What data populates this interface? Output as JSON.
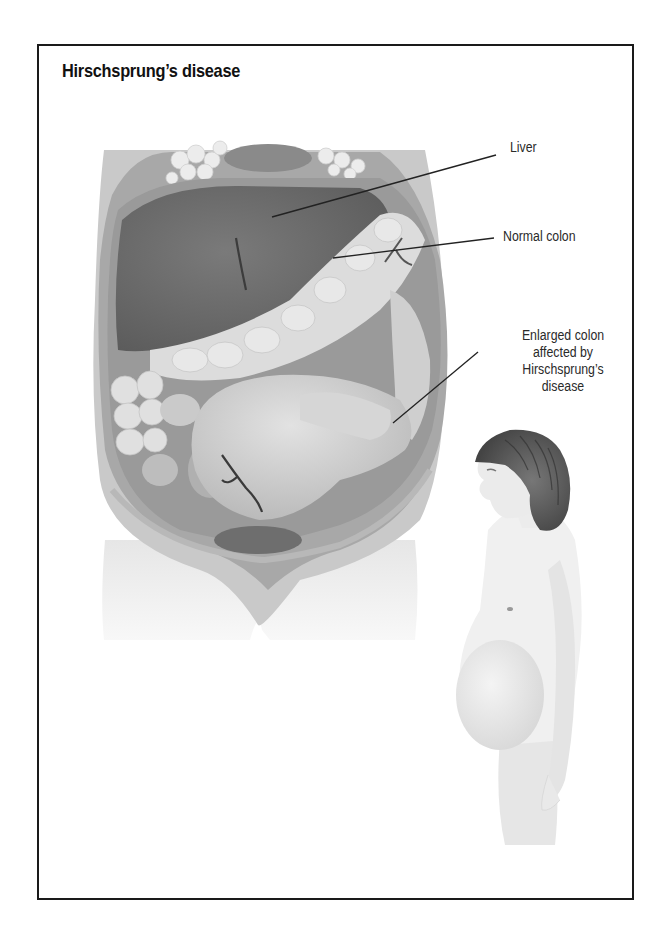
{
  "figure": {
    "title": "Hirschsprung’s disease",
    "labels": {
      "liver": "Liver",
      "normal_colon": "Normal colon",
      "enlarged_colon": {
        "line1": "Enlarged colon",
        "line2": "affected by",
        "line3": "Hirschsprung’s",
        "line4": "disease"
      }
    },
    "illustrations": {
      "abdomen": "abdominal-cross-section",
      "child": "child-profile-distended-abdomen"
    },
    "colors": {
      "frame": "#1a1a1a",
      "liver": "#6e6e6e",
      "normal_colon": "#d8d8d8",
      "enlarged_colon": "#c4c4c4",
      "body_wall": "#b5b5b5",
      "skin": "#ececec",
      "hair": "#5a5a5a"
    }
  }
}
